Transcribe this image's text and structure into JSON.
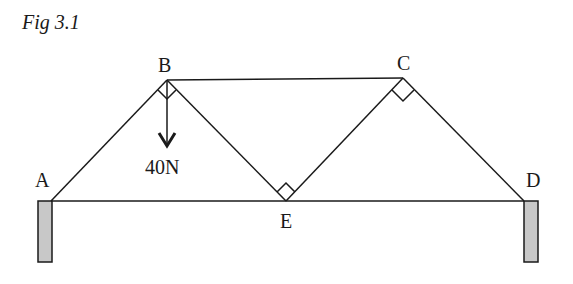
{
  "figure": {
    "title": "Fig 3.1"
  },
  "nodes": {
    "A": {
      "label": "A",
      "x": 51,
      "y": 201
    },
    "B": {
      "label": "B",
      "x": 167,
      "y": 80
    },
    "C": {
      "label": "C",
      "x": 403,
      "y": 78
    },
    "D": {
      "label": "D",
      "x": 524,
      "y": 201
    },
    "E": {
      "label": "E",
      "x": 286,
      "y": 201
    }
  },
  "members": [
    "AB",
    "BC",
    "CD",
    "AE",
    "ED",
    "BE",
    "EC"
  ],
  "right_angles": [
    "B",
    "C",
    "E"
  ],
  "load": {
    "node": "B",
    "label": "40N",
    "direction": "down"
  },
  "supports": [
    "A",
    "D"
  ],
  "colors": {
    "line": "#1a1a1a",
    "support_fill": "#c8c8c8"
  }
}
